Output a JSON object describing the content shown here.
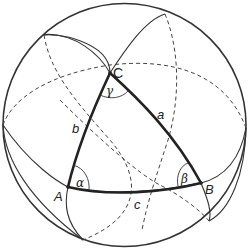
{
  "diagram": {
    "vertices": [
      {
        "id": "C",
        "label": "C"
      },
      {
        "id": "A",
        "label": "A"
      },
      {
        "id": "B",
        "label": "B"
      }
    ],
    "sides": [
      {
        "id": "a",
        "label": "a",
        "between": [
          "B",
          "C"
        ]
      },
      {
        "id": "b",
        "label": "b",
        "between": [
          "A",
          "C"
        ]
      },
      {
        "id": "c",
        "label": "c",
        "between": [
          "A",
          "B"
        ]
      }
    ],
    "angles": [
      {
        "id": "alpha",
        "label": "α",
        "at": "A"
      },
      {
        "id": "beta",
        "label": "β",
        "at": "B"
      },
      {
        "id": "gamma",
        "label": "γ",
        "at": "C"
      }
    ],
    "colors": {
      "stroke": "#333333",
      "triangle": "#222222",
      "background": "#ffffff"
    }
  }
}
